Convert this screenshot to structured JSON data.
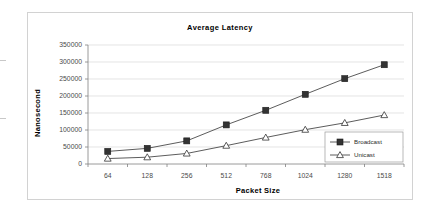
{
  "chart_data": {
    "type": "line",
    "title": "Average Latency",
    "xlabel": "Packet Size",
    "ylabel": "Nanosecond",
    "categories": [
      "64",
      "128",
      "256",
      "512",
      "768",
      "1024",
      "1280",
      "1518"
    ],
    "series": [
      {
        "name": "Broadcast",
        "marker": "filled-square",
        "color": "#333333",
        "values": [
          37000,
          46000,
          68000,
          115000,
          158000,
          205000,
          251000,
          292000
        ]
      },
      {
        "name": "Unicast",
        "marker": "open-triangle",
        "color": "#333333",
        "values": [
          16000,
          20000,
          31000,
          54000,
          78000,
          101000,
          121000,
          144000
        ]
      }
    ],
    "yticks": [
      0,
      50000,
      100000,
      150000,
      200000,
      250000,
      300000,
      350000
    ],
    "ytick_labels": [
      "0",
      "50000",
      "100000",
      "150000",
      "200000",
      "250000",
      "300000",
      "350000"
    ],
    "ylim": [
      0,
      350000
    ],
    "grid": true,
    "legend_position": "bottom-right"
  },
  "colors": {
    "frame": "#d2d2d2",
    "grid": "#d9d9d9",
    "axis": "#808080",
    "line": "#4a4a4a",
    "marker": "#333333",
    "text": "#000000",
    "tick_text": "#4a4a4a",
    "background": "#ffffff"
  }
}
